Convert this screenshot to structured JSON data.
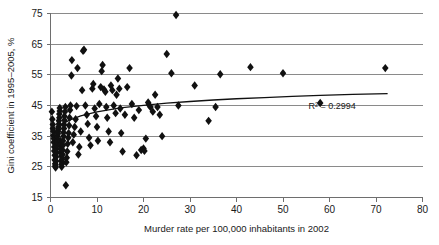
{
  "chart_data": {
    "type": "scatter",
    "title": "",
    "xlabel": "Murder rate per 100,000 inhabitants in 2002",
    "ylabel": "Gini coefficient in 1995–2005, %",
    "xlim": [
      0,
      80
    ],
    "ylim": [
      15,
      75
    ],
    "xticks": [
      0,
      10,
      20,
      30,
      40,
      50,
      60,
      70,
      80
    ],
    "yticks": [
      15,
      25,
      35,
      45,
      55,
      65,
      75
    ],
    "grid": "horizontal",
    "legend": "none",
    "annotations": [
      {
        "name": "r-squared",
        "text": "R² = 0.2994",
        "x": 55.5,
        "y": 44.0
      }
    ],
    "marker": {
      "shape": "diamond",
      "color": "#111111",
      "size": 4.2
    },
    "trendline": {
      "type": "logarithmic",
      "color": "#111111",
      "r_squared": 0.2994,
      "x_start": 0.6,
      "x_end": 72.5,
      "points": [
        [
          0.6,
          34.6
        ],
        [
          1.0,
          36.0
        ],
        [
          1.5,
          37.2
        ],
        [
          2.0,
          38.1
        ],
        [
          2.6,
          38.9
        ],
        [
          3.3,
          39.6
        ],
        [
          4.2,
          40.3
        ],
        [
          5.2,
          40.9
        ],
        [
          6.5,
          41.6
        ],
        [
          8.0,
          42.2
        ],
        [
          10.0,
          42.9
        ],
        [
          12.5,
          43.6
        ],
        [
          15.0,
          44.2
        ],
        [
          18.0,
          44.7
        ],
        [
          21.0,
          45.2
        ],
        [
          25.0,
          45.8
        ],
        [
          30.0,
          46.3
        ],
        [
          35.0,
          46.8
        ],
        [
          40.0,
          47.2
        ],
        [
          46.0,
          47.6
        ],
        [
          52.0,
          48.0
        ],
        [
          58.0,
          48.3
        ],
        [
          65.0,
          48.6
        ],
        [
          72.5,
          48.9
        ]
      ]
    },
    "points": [
      [
        0.3,
        43.0
      ],
      [
        0.4,
        40.5
      ],
      [
        0.5,
        38.8
      ],
      [
        0.5,
        37.5
      ],
      [
        0.6,
        36.6
      ],
      [
        0.6,
        35.2
      ],
      [
        0.7,
        34.2
      ],
      [
        0.7,
        33.0
      ],
      [
        0.8,
        31.5
      ],
      [
        0.8,
        30.2
      ],
      [
        0.9,
        28.8
      ],
      [
        0.9,
        27.2
      ],
      [
        1.0,
        26.0
      ],
      [
        1.0,
        25.2
      ],
      [
        1.1,
        24.8
      ],
      [
        1.1,
        25.6
      ],
      [
        1.2,
        26.8
      ],
      [
        1.2,
        28.2
      ],
      [
        1.3,
        29.5
      ],
      [
        1.3,
        30.8
      ],
      [
        1.4,
        32.0
      ],
      [
        1.4,
        33.2
      ],
      [
        1.5,
        34.0
      ],
      [
        1.5,
        35.0
      ],
      [
        1.6,
        35.8
      ],
      [
        1.6,
        36.5
      ],
      [
        1.7,
        37.2
      ],
      [
        1.7,
        38.0
      ],
      [
        1.8,
        39.0
      ],
      [
        1.8,
        40.0
      ],
      [
        1.9,
        41.0
      ],
      [
        1.9,
        42.2
      ],
      [
        2.0,
        43.2
      ],
      [
        2.0,
        44.2
      ],
      [
        2.1,
        33.5
      ],
      [
        2.1,
        32.2
      ],
      [
        2.2,
        31.0
      ],
      [
        2.2,
        29.8
      ],
      [
        2.3,
        28.5
      ],
      [
        2.3,
        27.0
      ],
      [
        2.4,
        25.8
      ],
      [
        2.4,
        25.0
      ],
      [
        2.5,
        26.2
      ],
      [
        2.5,
        27.5
      ],
      [
        2.6,
        29.0
      ],
      [
        2.6,
        30.5
      ],
      [
        2.7,
        32.0
      ],
      [
        2.7,
        33.5
      ],
      [
        2.8,
        35.0
      ],
      [
        2.8,
        36.2
      ],
      [
        2.9,
        37.5
      ],
      [
        2.9,
        38.8
      ],
      [
        3.0,
        40.2
      ],
      [
        3.0,
        41.5
      ],
      [
        3.1,
        43.0
      ],
      [
        3.2,
        44.5
      ],
      [
        3.3,
        19.0
      ],
      [
        3.4,
        26.5
      ],
      [
        3.5,
        28.0
      ],
      [
        3.6,
        30.0
      ],
      [
        3.7,
        32.5
      ],
      [
        3.8,
        34.5
      ],
      [
        3.9,
        36.0
      ],
      [
        4.0,
        38.5
      ],
      [
        4.1,
        41.0
      ],
      [
        4.2,
        43.5
      ],
      [
        4.3,
        45.0
      ],
      [
        4.5,
        54.8
      ],
      [
        4.6,
        59.8
      ],
      [
        4.8,
        33.0
      ],
      [
        5.0,
        35.5
      ],
      [
        5.2,
        38.0
      ],
      [
        5.4,
        40.5
      ],
      [
        5.6,
        44.8
      ],
      [
        5.8,
        57.2
      ],
      [
        6.0,
        29.0
      ],
      [
        6.2,
        31.5
      ],
      [
        6.5,
        36.5
      ],
      [
        6.8,
        50.0
      ],
      [
        7.0,
        62.8
      ],
      [
        7.2,
        63.2
      ],
      [
        7.5,
        45.0
      ],
      [
        7.8,
        42.0
      ],
      [
        8.0,
        39.0
      ],
      [
        8.3,
        34.5
      ],
      [
        8.6,
        32.0
      ],
      [
        9.0,
        50.5
      ],
      [
        9.2,
        52.0
      ],
      [
        9.5,
        44.0
      ],
      [
        9.8,
        41.5
      ],
      [
        10.0,
        38.0
      ],
      [
        10.2,
        33.5
      ],
      [
        10.5,
        45.5
      ],
      [
        10.8,
        51.0
      ],
      [
        11.0,
        56.2
      ],
      [
        11.2,
        58.2
      ],
      [
        11.5,
        50.2
      ],
      [
        11.8,
        49.5
      ],
      [
        12.0,
        44.5
      ],
      [
        12.2,
        41.0
      ],
      [
        12.5,
        36.5
      ],
      [
        12.8,
        33.0
      ],
      [
        13.0,
        51.5
      ],
      [
        13.3,
        50.0
      ],
      [
        13.6,
        45.0
      ],
      [
        14.0,
        42.5
      ],
      [
        14.2,
        48.5
      ],
      [
        14.5,
        53.8
      ],
      [
        14.8,
        50.5
      ],
      [
        15.0,
        44.0
      ],
      [
        15.2,
        36.0
      ],
      [
        15.5,
        30.0
      ],
      [
        16.0,
        42.0
      ],
      [
        16.5,
        51.0
      ],
      [
        17.0,
        57.2
      ],
      [
        17.5,
        45.5
      ],
      [
        18.0,
        41.0
      ],
      [
        18.5,
        28.8
      ],
      [
        19.0,
        43.5
      ],
      [
        19.5,
        30.5
      ],
      [
        20.0,
        31.0
      ],
      [
        20.2,
        30.2
      ],
      [
        20.5,
        34.2
      ],
      [
        21.0,
        46.0
      ],
      [
        21.2,
        45.2
      ],
      [
        21.5,
        44.5
      ],
      [
        22.0,
        43.0
      ],
      [
        22.5,
        48.5
      ],
      [
        23.0,
        44.5
      ],
      [
        23.5,
        42.0
      ],
      [
        24.0,
        35.0
      ],
      [
        25.0,
        61.8
      ],
      [
        26.0,
        55.5
      ],
      [
        27.0,
        74.5
      ],
      [
        27.5,
        45.0
      ],
      [
        31.0,
        51.5
      ],
      [
        34.0,
        40.0
      ],
      [
        35.5,
        44.5
      ],
      [
        36.5,
        55.2
      ],
      [
        43.0,
        57.5
      ],
      [
        50.0,
        55.5
      ],
      [
        58.0,
        45.8
      ],
      [
        72.0,
        57.2
      ]
    ]
  }
}
